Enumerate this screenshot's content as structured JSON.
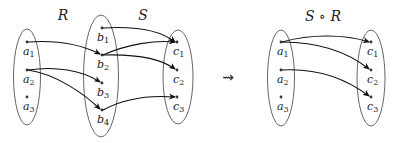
{
  "diagram": {
    "left": {
      "titles": {
        "R": "R",
        "S": "S"
      },
      "sets": {
        "A": {
          "elements": [
            {
              "id": "a1",
              "base": "a",
              "sub": "1"
            },
            {
              "id": "a2",
              "base": "a",
              "sub": "2"
            },
            {
              "id": "a3",
              "base": "a",
              "sub": "3"
            }
          ]
        },
        "B": {
          "elements": [
            {
              "id": "b1",
              "base": "b",
              "sub": "1"
            },
            {
              "id": "b2",
              "base": "b",
              "sub": "2"
            },
            {
              "id": "b3",
              "base": "b",
              "sub": "3"
            },
            {
              "id": "b4",
              "base": "b",
              "sub": "4"
            }
          ]
        },
        "C": {
          "elements": [
            {
              "id": "c1",
              "base": "c",
              "sub": "1"
            },
            {
              "id": "c2",
              "base": "c",
              "sub": "2"
            },
            {
              "id": "c3",
              "base": "c",
              "sub": "3"
            }
          ]
        }
      },
      "relation_R": [
        [
          "a1",
          "b2"
        ],
        [
          "a2",
          "b3"
        ],
        [
          "a2",
          "b4"
        ]
      ],
      "relation_S": [
        [
          "b1",
          "c1"
        ],
        [
          "b2",
          "c1"
        ],
        [
          "b2",
          "c2"
        ],
        [
          "b4",
          "c3"
        ]
      ]
    },
    "transition_symbol": "⇝",
    "right": {
      "title": "S ∘ R",
      "sets": {
        "A": {
          "elements": [
            {
              "id": "a1",
              "base": "a",
              "sub": "1"
            },
            {
              "id": "a2",
              "base": "a",
              "sub": "2"
            },
            {
              "id": "a3",
              "base": "a",
              "sub": "3"
            }
          ]
        },
        "C": {
          "elements": [
            {
              "id": "c1",
              "base": "c",
              "sub": "1"
            },
            {
              "id": "c2",
              "base": "c",
              "sub": "2"
            },
            {
              "id": "c3",
              "base": "c",
              "sub": "3"
            }
          ]
        }
      },
      "relation_SR": [
        [
          "a1",
          "c1"
        ],
        [
          "a1",
          "c2"
        ],
        [
          "a2",
          "c3"
        ]
      ]
    }
  }
}
